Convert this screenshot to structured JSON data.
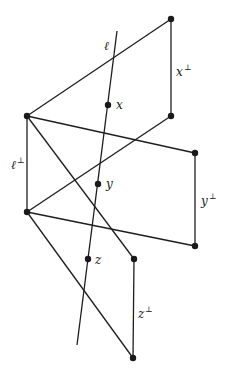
{
  "diagram": {
    "title": "",
    "vertices": [
      {
        "id": "xperp_top",
        "x": 171,
        "y": 19
      },
      {
        "id": "x",
        "x": 108,
        "y": 105,
        "label": "x"
      },
      {
        "id": "xperp_bot",
        "x": 171,
        "y": 116
      },
      {
        "id": "lperp_top",
        "x": 27,
        "y": 116
      },
      {
        "id": "yperp_top",
        "x": 195,
        "y": 153
      },
      {
        "id": "y",
        "x": 98,
        "y": 184,
        "label": "y"
      },
      {
        "id": "lperp_bot",
        "x": 27,
        "y": 212
      },
      {
        "id": "yperp_bot",
        "x": 195,
        "y": 246
      },
      {
        "id": "z",
        "x": 88,
        "y": 259,
        "label": "z"
      },
      {
        "id": "zperp_top",
        "x": 134,
        "y": 259
      },
      {
        "id": "zperp_bot",
        "x": 133,
        "y": 358
      }
    ],
    "line_l": {
      "x1": 117,
      "y1": 31,
      "x2": 77,
      "y2": 345,
      "label": "ℓ"
    },
    "labels": {
      "l": "ℓ",
      "x": "x",
      "y": "y",
      "z": "z",
      "perp": "⊥",
      "l_perp_base": "ℓ",
      "x_perp_base": "x",
      "y_perp_base": "y",
      "z_perp_base": "z"
    }
  }
}
